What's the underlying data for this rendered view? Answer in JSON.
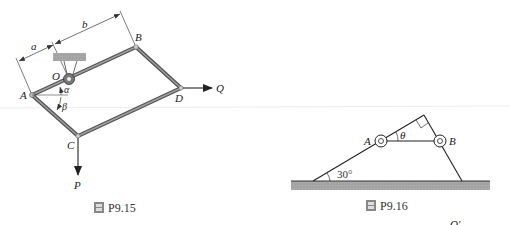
{
  "figures": [
    {
      "id": "fig-left",
      "caption_number": "P9.15",
      "caption_icon": "figure-icon",
      "points": {
        "A": "A",
        "B": "B",
        "C": "C",
        "D": "D",
        "O": "O"
      },
      "dimensions": {
        "a": "a",
        "b": "b"
      },
      "angles": {
        "alpha": "α",
        "beta": "β"
      },
      "forces": {
        "P": "P",
        "Q": "Q"
      }
    },
    {
      "id": "fig-right",
      "caption_number": "P9.16",
      "caption_icon": "figure-icon",
      "points": {
        "A": "A",
        "B": "B"
      },
      "angles": {
        "theta": "θ",
        "base": "30°"
      },
      "partial_label": "O'"
    }
  ],
  "colors": {
    "ink": "#222222",
    "bar_dark": "#555555",
    "bar_light": "#9a9a9a",
    "ground": "#a8a8a8",
    "support": "#b0b0b0",
    "page_rule": "#e6e6e6"
  }
}
